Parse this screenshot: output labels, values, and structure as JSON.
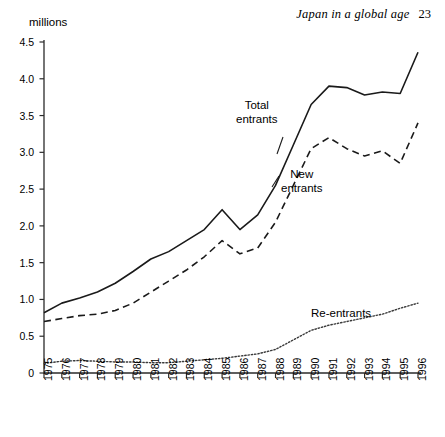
{
  "running_head": {
    "title": "Japan in a global age",
    "page_number": "23"
  },
  "chart_data": {
    "type": "line",
    "title": "",
    "subtitle": "",
    "xlabel": "",
    "ylabel": "millions",
    "unit_caption": "millions",
    "grid": false,
    "legend_position": "inline-annotations",
    "xlim": [
      1975,
      1996
    ],
    "ylim": [
      0,
      4.5
    ],
    "yticks": [
      "4.5",
      "4.0",
      "3.5",
      "3.0",
      "2.5",
      "2.0",
      "1.5",
      "1.0",
      "0.5",
      "0"
    ],
    "ytick_values": [
      4.5,
      4.0,
      3.5,
      3.0,
      2.5,
      2.0,
      1.5,
      1.0,
      0.5,
      0
    ],
    "categories": [
      "1975",
      "1976",
      "1977",
      "1978",
      "1979",
      "1980",
      "1981",
      "1982",
      "1983",
      "1984",
      "1985",
      "1986",
      "1987",
      "1988",
      "1989",
      "1990",
      "1991",
      "1992",
      "1993",
      "1994",
      "1995",
      "1996"
    ],
    "x": [
      1975,
      1976,
      1977,
      1978,
      1979,
      1980,
      1981,
      1982,
      1983,
      1984,
      1985,
      1986,
      1987,
      1988,
      1989,
      1990,
      1991,
      1992,
      1993,
      1994,
      1995,
      1996
    ],
    "series": [
      {
        "name": "Total entrants",
        "style": "solid",
        "color": "#1a1a1a",
        "values": [
          0.82,
          0.95,
          1.02,
          1.1,
          1.22,
          1.38,
          1.55,
          1.65,
          1.8,
          1.95,
          2.22,
          1.95,
          2.15,
          2.55,
          3.1,
          3.65,
          3.9,
          3.88,
          3.78,
          3.82,
          3.8,
          4.36
        ]
      },
      {
        "name": "New entrants",
        "style": "dashed",
        "color": "#1a1a1a",
        "values": [
          0.7,
          0.74,
          0.78,
          0.8,
          0.85,
          0.95,
          1.1,
          1.25,
          1.4,
          1.58,
          1.8,
          1.62,
          1.7,
          2.05,
          2.55,
          3.05,
          3.2,
          3.05,
          2.95,
          3.02,
          2.85,
          3.4
        ]
      },
      {
        "name": "Re-entrants",
        "style": "dotted",
        "color": "#3a3a3a",
        "values": [
          0.13,
          0.16,
          0.17,
          0.16,
          0.15,
          0.15,
          0.14,
          0.14,
          0.16,
          0.18,
          0.2,
          0.23,
          0.26,
          0.32,
          0.45,
          0.58,
          0.65,
          0.7,
          0.75,
          0.8,
          0.88,
          0.95
        ]
      }
    ],
    "annotations": [
      {
        "id": "total",
        "text_line1": "Total",
        "text_line2": "entrants"
      },
      {
        "id": "new",
        "text_line1": "New",
        "text_line2": "entrants"
      },
      {
        "id": "reentrants",
        "text_line1": "Re-entrants",
        "text_line2": ""
      }
    ]
  }
}
